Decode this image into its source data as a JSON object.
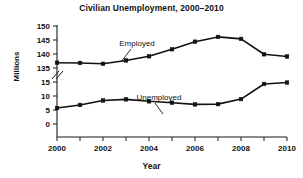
{
  "chart_data": {
    "type": "line",
    "title": "Civilian Unemployment, 2000–2010",
    "xlabel": "Year",
    "ylabel": "Millions",
    "x": [
      2000,
      2001,
      2002,
      2003,
      2004,
      2005,
      2006,
      2007,
      2008,
      2009,
      2010
    ],
    "xtick_labels": [
      "2000",
      "2002",
      "2004",
      "2006",
      "2008",
      "2010"
    ],
    "xtick_values": [
      2000,
      2002,
      2004,
      2006,
      2008,
      2010
    ],
    "xlim": [
      2000,
      2010
    ],
    "ytick_labels": [
      "0",
      "5",
      "10",
      "15",
      "135",
      "140",
      "145",
      "150"
    ],
    "ytick_values": [
      0,
      5,
      10,
      15,
      135,
      140,
      145,
      150
    ],
    "ylim": [
      0,
      150
    ],
    "axis_break": true,
    "axis_break_between": [
      15,
      135
    ],
    "grid": false,
    "legend": "inline-annotations",
    "series": [
      {
        "name": "Employed",
        "annotation": "Employed",
        "values": [
          136.9,
          136.8,
          136.5,
          137.7,
          139.2,
          141.7,
          144.4,
          146.1,
          145.4,
          139.9,
          139.1
        ]
      },
      {
        "name": "Unemployed",
        "annotation": "Unemployed",
        "values": [
          5.7,
          6.8,
          8.4,
          8.8,
          8.1,
          7.6,
          7.0,
          7.1,
          8.9,
          14.3,
          14.8
        ]
      }
    ],
    "colors": {
      "line": "#111111",
      "marker": "#111111",
      "axis": "#1a1a1a",
      "background": "#ffffff"
    }
  }
}
